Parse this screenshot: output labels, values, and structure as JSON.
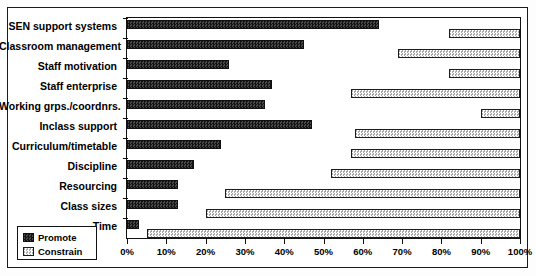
{
  "chart_data": {
    "type": "bar",
    "orientation": "horizontal",
    "title": "",
    "xlabel": "",
    "ylabel": "",
    "xlim": [
      0,
      100
    ],
    "xticks": [
      "0%",
      "10%",
      "20%",
      "30%",
      "40%",
      "50%",
      "60%",
      "70%",
      "80%",
      "90%",
      "100%"
    ],
    "xtick_values": [
      0,
      10,
      20,
      30,
      40,
      50,
      60,
      70,
      80,
      90,
      100
    ],
    "grid": false,
    "legend_position": "bottom-left",
    "categories": [
      "SEN support systems",
      "Classroom management",
      "Staff motivation",
      "Staff enterprise",
      "Working grps./coordnrs.",
      "Inclass support",
      "Curriculum/timetable",
      "Discipline",
      "Resourcing",
      "Class sizes",
      "Time"
    ],
    "series": [
      {
        "name": "Promote",
        "color": "#2e2e2e",
        "note": "bar starts at 0% and extends rightwards",
        "start": [
          0,
          0,
          0,
          0,
          0,
          0,
          0,
          0,
          0,
          0,
          0
        ],
        "values": [
          64,
          45,
          26,
          37,
          35,
          47,
          24,
          17,
          13,
          13,
          3
        ]
      },
      {
        "name": "Constrain",
        "color": "#d2d2d2",
        "note": "bar spans from start value to 100%",
        "start": [
          82,
          69,
          82,
          57,
          90,
          58,
          57,
          52,
          25,
          20,
          5
        ],
        "values": [
          18,
          31,
          18,
          43,
          10,
          42,
          43,
          48,
          75,
          80,
          95
        ]
      }
    ]
  },
  "legend": {
    "items": [
      {
        "label": "Promote",
        "swatch": "promote-swatch"
      },
      {
        "label": "Constrain",
        "swatch": "constrain-swatch"
      }
    ]
  }
}
